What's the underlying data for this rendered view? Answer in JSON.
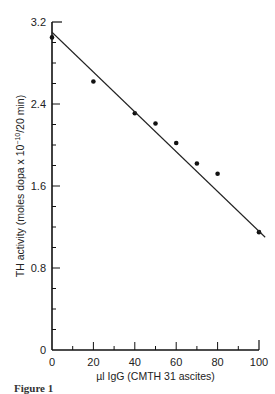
{
  "chart_data": {
    "type": "scatter",
    "title": "",
    "xlabel": "µl IgG (CMTH 31 ascites)",
    "ylabel": "TH activity (moles dopa x 10^-10/20 min)",
    "xlim": [
      0,
      100
    ],
    "ylim": [
      0,
      3.2
    ],
    "x_ticks": [
      "0",
      "20",
      "40",
      "60",
      "80",
      "100"
    ],
    "y_ticks": [
      "0",
      "0.8",
      "1.6",
      "2.4",
      "3.2"
    ],
    "grid": false,
    "legend": null,
    "series": [
      {
        "name": "measured",
        "type": "scatter",
        "x": [
          0,
          20,
          40,
          50,
          60,
          70,
          80,
          100
        ],
        "y": [
          3.05,
          2.62,
          2.31,
          2.21,
          2.02,
          1.82,
          1.72,
          1.15
        ]
      },
      {
        "name": "fit",
        "type": "line",
        "x": [
          0,
          103
        ],
        "y": [
          3.1,
          1.1
        ]
      }
    ]
  },
  "labels": {
    "x_axis": "µl IgG (CMTH 31 ascites)",
    "y_axis_main": "TH activity (moles dopa x 10",
    "y_axis_exp": "−10",
    "y_axis_tail": "/20 min)",
    "caption": "Figure 1"
  }
}
